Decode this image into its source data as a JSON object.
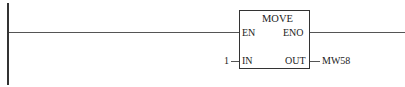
{
  "diagram": {
    "type": "ladder-logic",
    "block": {
      "name": "MOVE",
      "pins": {
        "en": "EN",
        "eno": "ENO",
        "in": "IN",
        "out": "OUT"
      }
    },
    "inputs": {
      "in_value": "1"
    },
    "outputs": {
      "out_value": "MW58"
    },
    "colors": {
      "line": "#333333",
      "background": "#ffffff"
    }
  }
}
